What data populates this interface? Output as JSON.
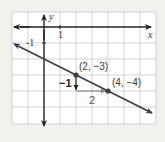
{
  "diagram": {
    "type": "coordinate-plane-graph",
    "axes": {
      "x_label": "x",
      "y_label": "y",
      "x_tick_label": "1",
      "y_tick_label": "-1"
    },
    "line": {
      "slope_rise": "-1",
      "slope_run": "2",
      "equation_implied": "y = -1/2 x - 2"
    },
    "points": [
      {
        "label": "(2, −3)",
        "x": 2,
        "y": -3
      },
      {
        "label": "(4, −4)",
        "x": 4,
        "y": -4
      }
    ],
    "rise_label": "−1",
    "run_label": "2",
    "colors": {
      "background": "#f1f1ee",
      "grid_bg": "#ffffff",
      "grid_line": "#c8c8c8",
      "axis": "#222222",
      "graph_line": "#3c3c46",
      "slope_arrow": "#888888"
    }
  }
}
